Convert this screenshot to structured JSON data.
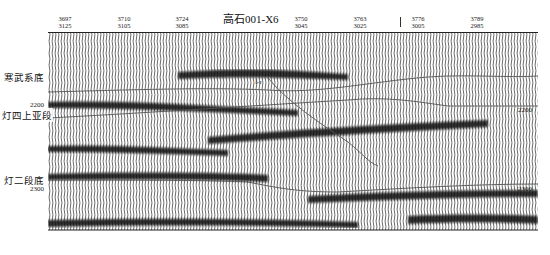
{
  "figure": {
    "well_name": "高石001-X6",
    "top_axis": {
      "ticks": [
        {
          "cdp": "3697",
          "trace": "3125",
          "x": 65
        },
        {
          "cdp": "3710",
          "trace": "3105",
          "x": 124
        },
        {
          "cdp": "3724",
          "trace": "3085",
          "x": 182
        },
        {
          "cdp": "3750",
          "trace": "3045",
          "x": 301
        },
        {
          "cdp": "3763",
          "trace": "3025",
          "x": 360
        },
        {
          "cdp": "3776",
          "trace": "3005",
          "x": 418
        },
        {
          "cdp": "3789",
          "trace": "2985",
          "x": 477
        }
      ],
      "well_marker_x": 400
    },
    "depth_labels": {
      "left_2200": "2200",
      "left_2300": "2300",
      "right_2200": "2200",
      "right_2300": "2300"
    },
    "horizons": [
      {
        "name": "寒武系底",
        "label_x": 3,
        "label_y": 70
      },
      {
        "name": "灯四上亚段",
        "label_x": 1,
        "label_y": 108
      },
      {
        "name": "灯二段底",
        "label_x": 3,
        "label_y": 173
      }
    ],
    "well_annotation": "Ⅰ-ε",
    "colors": {
      "trace": "#1a1a1a",
      "horizon_line": "#555555",
      "background": "#ffffff"
    }
  }
}
